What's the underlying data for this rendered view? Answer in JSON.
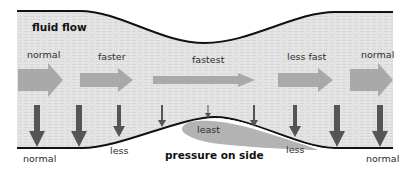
{
  "title": "fluid flow",
  "colors": {
    "fluid": "#e2e2e2",
    "fluid_dark": "#d4d4d4",
    "wall": "#111111",
    "flow_arrow": "#a9a9a9",
    "pressure_arrow": "#555555",
    "least_blob": "#b3b3b3"
  },
  "flow_labels": [
    {
      "text": "normal"
    },
    {
      "text": "faster"
    },
    {
      "text": "fastest"
    },
    {
      "text": "less fast"
    },
    {
      "text": "normal"
    }
  ],
  "pressure_labels": {
    "left": "normal",
    "left_less": "less",
    "least": "least",
    "right_less": "less",
    "right": "normal",
    "caption": "pressure on side"
  }
}
